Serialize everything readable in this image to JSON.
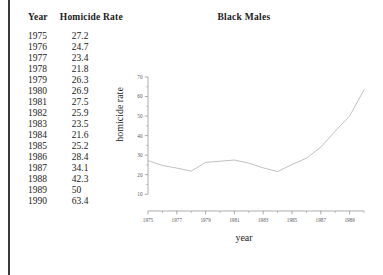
{
  "page": {
    "rule_color": "#3a3a3a",
    "background": "#ffffff"
  },
  "table": {
    "headers": [
      "Year",
      "Homicide Rate"
    ],
    "header_year": "Year",
    "header_rate": "Homicide Rate",
    "rows": [
      {
        "year": "1975",
        "rate": "27.2"
      },
      {
        "year": "1976",
        "rate": "24.7"
      },
      {
        "year": "1977",
        "rate": "23.4"
      },
      {
        "year": "1978",
        "rate": "21.8"
      },
      {
        "year": "1979",
        "rate": "26.3"
      },
      {
        "year": "1980",
        "rate": "26.9"
      },
      {
        "year": "1981",
        "rate": "27.5"
      },
      {
        "year": "1982",
        "rate": "25.9"
      },
      {
        "year": "1983",
        "rate": "23.5"
      },
      {
        "year": "1984",
        "rate": "21.6"
      },
      {
        "year": "1985",
        "rate": "25.2"
      },
      {
        "year": "1986",
        "rate": "28.4"
      },
      {
        "year": "1987",
        "rate": "34.1"
      },
      {
        "year": "1988",
        "rate": "42.3"
      },
      {
        "year": "1989",
        "rate": "50"
      },
      {
        "year": "1990",
        "rate": "63.4"
      }
    ]
  },
  "chart": {
    "title": "Black Males",
    "xlabel": "year",
    "ylabel": "homicide rate",
    "line_color": "#b9b9b9",
    "axis_color": "#8a8a8a"
  },
  "chart_data": {
    "type": "line",
    "title": "Black Males",
    "xlabel": "year",
    "ylabel": "homicide rate",
    "x": [
      1975,
      1976,
      1977,
      1978,
      1979,
      1980,
      1981,
      1982,
      1983,
      1984,
      1985,
      1986,
      1987,
      1988,
      1989,
      1990
    ],
    "values": [
      27.2,
      24.7,
      23.4,
      21.8,
      26.3,
      26.9,
      27.5,
      25.9,
      23.5,
      21.6,
      25.2,
      28.4,
      34.1,
      42.3,
      50,
      63.4
    ],
    "series": [
      {
        "name": "Black Males",
        "values": [
          27.2,
          24.7,
          23.4,
          21.8,
          26.3,
          26.9,
          27.5,
          25.9,
          23.5,
          21.6,
          25.2,
          28.4,
          34.1,
          42.3,
          50,
          63.4
        ]
      }
    ],
    "xlim": [
      1975,
      1990
    ],
    "ylim": [
      5,
      70
    ],
    "xticks": [
      1975,
      1977,
      1979,
      1981,
      1983,
      1985,
      1987,
      1989
    ],
    "xticklabels": [
      "1975",
      "1977",
      "1979",
      "1981",
      "1983",
      "1985",
      "1987",
      "1989"
    ],
    "yticks": [
      10,
      20,
      30,
      40,
      50,
      60,
      70
    ],
    "yticklabels": [
      "10",
      "20",
      "30",
      "40",
      "50",
      "60",
      "70"
    ],
    "grid": false,
    "legend": false,
    "marker": "none"
  }
}
